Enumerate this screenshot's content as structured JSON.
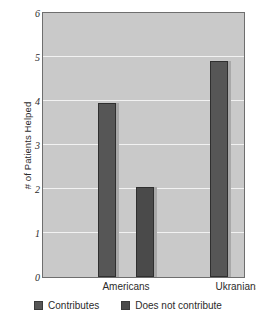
{
  "chart_data": {
    "type": "bar",
    "title": "",
    "xlabel": "",
    "ylabel": "# of Patients Helped",
    "categories": [
      "Americans",
      "Ukranians"
    ],
    "series": [
      {
        "name": "Contributes",
        "values": [
          3.95,
          4.9
        ],
        "color": "#565656"
      },
      {
        "name": "Does not contribute",
        "values": [
          2.05,
          0.9
        ],
        "color": "#4a4a4a"
      }
    ],
    "ylim": [
      0,
      6
    ],
    "yticks": [
      0,
      1,
      2,
      3,
      4,
      5,
      6
    ],
    "ytick_labels": [
      "0",
      "1",
      "2",
      "3",
      "4",
      "5",
      "6"
    ],
    "grid": true,
    "legend_position": "bottom",
    "plot_background": "#c9c9c9",
    "figure_background": "#ffffff"
  }
}
